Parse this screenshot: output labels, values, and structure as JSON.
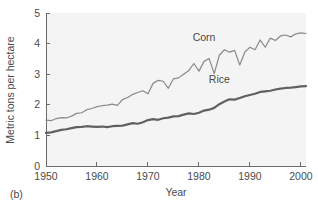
{
  "chart_data": {
    "type": "line",
    "title": "",
    "panel_caption": "(b)",
    "xlabel": "Year",
    "ylabel": "Metric tons per hectare",
    "xlim": [
      1950,
      2001
    ],
    "ylim": [
      0,
      5
    ],
    "xticks": [
      1950,
      1960,
      1970,
      1980,
      1990,
      2000
    ],
    "xticklabels": [
      "1950",
      "1960",
      "1970",
      "1980",
      "1990",
      "2000"
    ],
    "yticks": [
      0,
      1,
      2,
      3,
      4,
      5
    ],
    "yticklabels": [
      "0",
      "1",
      "2",
      "3",
      "4",
      "5"
    ],
    "grid": false,
    "legend": "inline-annotations",
    "x": [
      1950,
      1951,
      1952,
      1953,
      1954,
      1955,
      1956,
      1957,
      1958,
      1959,
      1960,
      1961,
      1962,
      1963,
      1964,
      1965,
      1966,
      1967,
      1968,
      1969,
      1970,
      1971,
      1972,
      1973,
      1974,
      1975,
      1976,
      1977,
      1978,
      1979,
      1980,
      1981,
      1982,
      1983,
      1984,
      1985,
      1986,
      1987,
      1988,
      1989,
      1990,
      1991,
      1992,
      1993,
      1994,
      1995,
      1996,
      1997,
      1998,
      1999,
      2000,
      2001
    ],
    "series": [
      {
        "name": "Corn",
        "color": "#8a8a8a",
        "width": 1.2,
        "label_x": 1981,
        "label_y": 4.1,
        "values": [
          1.5,
          1.48,
          1.55,
          1.58,
          1.57,
          1.63,
          1.72,
          1.74,
          1.84,
          1.88,
          1.94,
          1.97,
          1.99,
          2.02,
          1.98,
          2.17,
          2.24,
          2.34,
          2.4,
          2.46,
          2.36,
          2.7,
          2.8,
          2.77,
          2.54,
          2.85,
          2.88,
          3.0,
          3.12,
          3.35,
          3.1,
          3.42,
          3.51,
          3.02,
          3.62,
          3.8,
          3.72,
          3.78,
          3.3,
          3.72,
          3.88,
          3.8,
          4.12,
          3.88,
          4.18,
          4.1,
          4.25,
          4.28,
          4.22,
          4.32,
          4.35,
          4.33
        ]
      },
      {
        "name": "Rice",
        "color": "#606060",
        "width": 2.2,
        "label_x": 1984,
        "label_y": 2.72,
        "values": [
          1.08,
          1.1,
          1.14,
          1.18,
          1.2,
          1.24,
          1.27,
          1.28,
          1.3,
          1.29,
          1.28,
          1.29,
          1.27,
          1.3,
          1.31,
          1.32,
          1.36,
          1.4,
          1.38,
          1.43,
          1.5,
          1.53,
          1.51,
          1.56,
          1.58,
          1.62,
          1.63,
          1.68,
          1.72,
          1.7,
          1.74,
          1.81,
          1.84,
          1.9,
          2.02,
          2.11,
          2.18,
          2.17,
          2.22,
          2.28,
          2.32,
          2.36,
          2.42,
          2.44,
          2.46,
          2.5,
          2.53,
          2.55,
          2.56,
          2.58,
          2.6,
          2.61
        ]
      }
    ]
  },
  "figure": {
    "background_color": "#ffffff",
    "plot_background_color": "#f4f4f4",
    "axis_color": "#6b6b6b"
  }
}
